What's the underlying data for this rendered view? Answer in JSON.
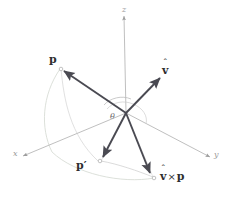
{
  "figure": {
    "background": "#ffffff",
    "width": 231,
    "height": 204
  },
  "colors": {
    "vector_dark": "#4a4a52",
    "axis_gray": "#b2b2b2",
    "guide_light": "#cfcfcf",
    "arc_light": "#d2d6cf",
    "text_dark": "#2e2e2e",
    "text_axis": "#9a9a9a",
    "text_angle": "#6a6a6a"
  },
  "axes": {
    "origin_label": "",
    "x": {
      "label": "x",
      "tip_x": 14,
      "tip_y": 157
    },
    "y": {
      "label": "y",
      "tip_x": 216,
      "tip_y": 158
    },
    "z": {
      "label": "z",
      "tip_x": 124,
      "tip_y": 11
    }
  },
  "vectors": [
    {
      "name": "p",
      "label": "p",
      "hat": false,
      "tip_x": 60,
      "tip_y": 68
    },
    {
      "name": "v-hat",
      "label": "v",
      "hat": true,
      "tip_x": 163,
      "tip_y": 74
    },
    {
      "name": "p-prime",
      "label": "p′",
      "hat": false,
      "tip_x": 100,
      "tip_y": 160
    },
    {
      "name": "v-cross-p",
      "label": "v",
      "hat": true,
      "tip_x": 152,
      "tip_y": 177
    }
  ],
  "labels": {
    "p": "p",
    "p_prime": "p′",
    "v_hat": "v",
    "v_cross_p_v": "v",
    "cross_symbol": "×",
    "cross_p": "p",
    "theta": "θ",
    "x_axis": "x",
    "y_axis": "y",
    "z_axis": "z",
    "hat_mark": "ˆ"
  },
  "annotations": {
    "angle_name": "theta-angle-arc",
    "rotation_arc": "rotation-path-arc",
    "projection_guides": "projection-guide-lines"
  }
}
